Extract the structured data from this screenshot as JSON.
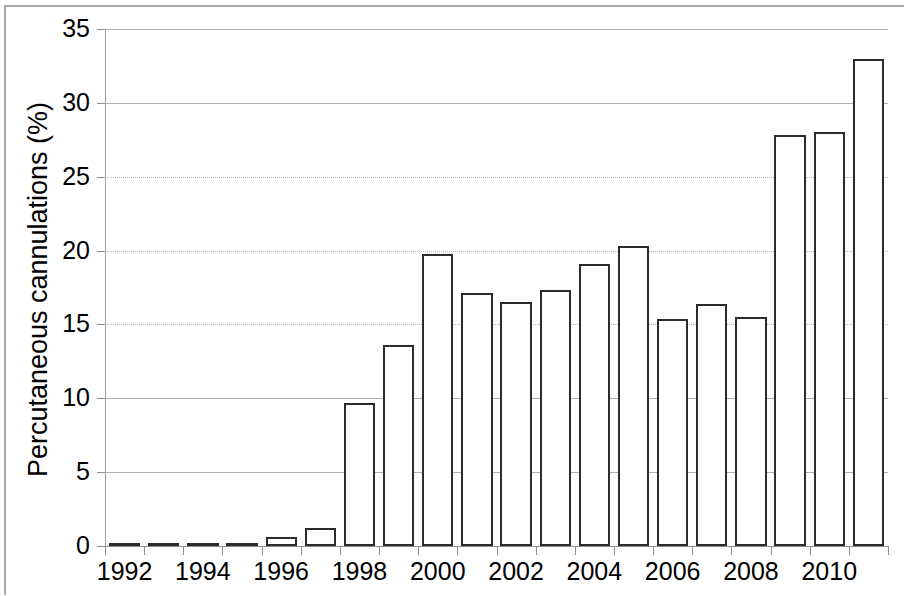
{
  "chart_data": {
    "type": "bar",
    "title": "",
    "xlabel": "",
    "ylabel": "Percutaneous cannulations (%)",
    "categories": [
      1992,
      1993,
      1994,
      1995,
      1996,
      1997,
      1998,
      1999,
      2000,
      2001,
      2002,
      2003,
      2004,
      2005,
      2006,
      2007,
      2008,
      2009,
      2010,
      2011
    ],
    "values": [
      0.1,
      0.1,
      0.1,
      0.1,
      0.6,
      1.2,
      9.7,
      13.6,
      19.8,
      17.1,
      16.5,
      17.3,
      19.1,
      20.3,
      15.4,
      16.4,
      15.5,
      27.8,
      28.0,
      33.0
    ],
    "ylim": [
      0,
      35
    ],
    "y_ticks": [
      0,
      5,
      10,
      15,
      20,
      25,
      30,
      35
    ],
    "y_tick_labels": [
      "0",
      "5",
      "10",
      "15",
      "20",
      "25",
      "30",
      "35"
    ],
    "x_tick_labels": [
      "1992",
      "1994",
      "1996",
      "1998",
      "2000",
      "2002",
      "2004",
      "2006",
      "2008",
      "2010"
    ],
    "x_tick_years": [
      1992,
      1994,
      1996,
      1998,
      2000,
      2002,
      2004,
      2006,
      2008,
      2010
    ],
    "grid": true,
    "grid_axis": "y",
    "legend": false,
    "legend_position": "none",
    "bar_fill_color": "#ffffff",
    "bar_edge_color": "#2b2b2b",
    "gridline_color": "#b5b5b5",
    "axis_color": "#8f8f8f",
    "text_color": "#000000",
    "background_color": "#ffffff"
  }
}
